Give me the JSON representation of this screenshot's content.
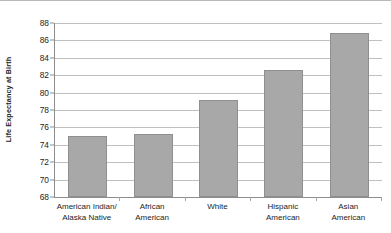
{
  "chart_data": {
    "type": "bar",
    "title": "",
    "xlabel": "",
    "ylabel": "Life Expectancy at Birth",
    "ylim": [
      68,
      88
    ],
    "ytick_step": 2,
    "grid": true,
    "legend": "none",
    "bar_color": "#a8a8a8",
    "bar_edge_color": "#8f8f8f",
    "gridline_color": "#c0c0c0",
    "axis_color": "#8d8d8d",
    "text_color": "#1d1d1d",
    "yticks": [
      88,
      86,
      84,
      82,
      80,
      78,
      76,
      74,
      72,
      70,
      68
    ],
    "categories": [
      "American Indian/ Alaska Native",
      "African American",
      "White",
      "Hispanic American",
      "Asian American"
    ],
    "category_lines": [
      [
        "American Indian/",
        "Alaska Native"
      ],
      [
        "African",
        "American"
      ],
      [
        "White",
        ""
      ],
      [
        "Hispanic",
        "American"
      ],
      [
        "Asian",
        "American"
      ]
    ],
    "values": [
      75.0,
      75.2,
      79.2,
      82.6,
      86.9
    ]
  }
}
